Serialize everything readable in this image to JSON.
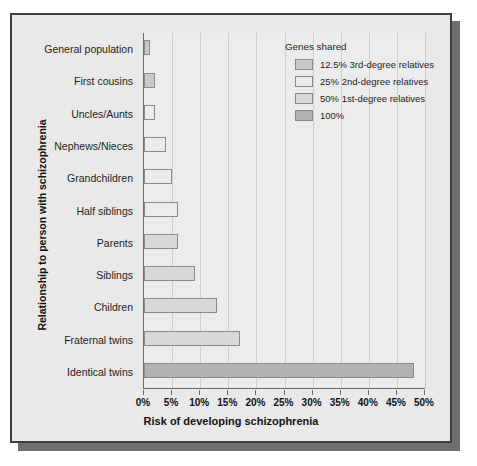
{
  "chart_data": {
    "type": "bar",
    "orientation": "horizontal",
    "title": "",
    "xlabel": "Risk of developing schizophrenia",
    "ylabel": "Relationship to person with schizophrenia",
    "xlim": [
      0,
      50
    ],
    "xtick_labels": [
      "0%",
      "5%",
      "10%",
      "15%",
      "20%",
      "25%",
      "30%",
      "35%",
      "40%",
      "45%",
      "50%"
    ],
    "xtick_values": [
      0,
      5,
      10,
      15,
      20,
      25,
      30,
      35,
      40,
      45,
      50
    ],
    "grid": true,
    "grid_axis": "x",
    "legend_position": "upper right inside plot",
    "categories": [
      "General population",
      "First cousins",
      "Uncles/Aunts",
      "Nephews/Nieces",
      "Grandchildren",
      "Half siblings",
      "Parents",
      "Siblings",
      "Children",
      "Fraternal twins",
      "Identical twins"
    ],
    "values": [
      1,
      2,
      2,
      4,
      5,
      6,
      6,
      9,
      13,
      17,
      48
    ],
    "value_units": "%",
    "bar_groups": [
      "12.5% 3rd-degree relatives",
      "12.5% 3rd-degree relatives",
      "25% 2nd-degree relatives",
      "25% 2nd-degree relatives",
      "25% 2nd-degree relatives",
      "25% 2nd-degree relatives",
      "50% 1st-degree relatives",
      "50% 1st-degree relatives",
      "50% 1st-degree relatives",
      "50% 1st-degree relatives",
      "100%"
    ],
    "legend": {
      "title": "Genes shared",
      "entries": [
        {
          "label": "12.5% 3rd-degree relatives",
          "color": "#c9c9c9",
          "key": "g125"
        },
        {
          "label": "25% 2nd-degree relatives",
          "color": "#ececec",
          "key": "g25"
        },
        {
          "label": "50% 1st-degree relatives",
          "color": "#d8d8d8",
          "key": "g50"
        },
        {
          "label": "100%",
          "color": "#b2b2b2",
          "key": "g100"
        }
      ]
    },
    "colors": {
      "g125": "#c9c9c9",
      "g25": "#ececec",
      "g50": "#d8d8d8",
      "g100": "#b2b2b2",
      "bar_outline": "#8a8a8a",
      "axis": "#6b6b6b",
      "grid": "#cfcfcf",
      "plot_background": "#ececec",
      "frame_background": "#e9e9e9",
      "frame_border": "#3f3f3f",
      "shadow": "#6e6e6e",
      "text": "#111111"
    }
  }
}
